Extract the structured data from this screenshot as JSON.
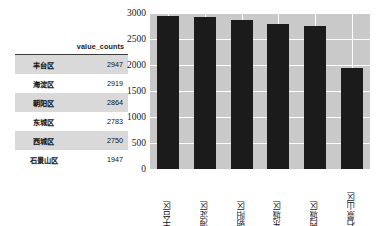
{
  "table": {
    "index_header": "",
    "column_header": "value_counts",
    "rows": [
      {
        "district": "丰台区",
        "count": "2947"
      },
      {
        "district": "海淀区",
        "count": "2919"
      },
      {
        "district": "朝阳区",
        "count": "2864"
      },
      {
        "district": "东城区",
        "count": "2783"
      },
      {
        "district": "西城区",
        "count": "2750"
      },
      {
        "district": "石景山区",
        "count": "1947"
      }
    ]
  },
  "chart_data": {
    "type": "bar",
    "title": "",
    "xlabel": "",
    "ylabel": "",
    "categories": [
      "丰台区",
      "海淀区",
      "朝阳区",
      "东城区",
      "西城区",
      "石景山区"
    ],
    "values": [
      2947,
      2919,
      2864,
      2783,
      2750,
      1947
    ],
    "ylim": [
      0,
      3000
    ],
    "yticks": [
      "0",
      "500",
      "1000",
      "1500",
      "2000",
      "2500",
      "3000"
    ],
    "ytick_values": [
      0,
      500,
      1000,
      1500,
      2000,
      2500,
      3000
    ],
    "grid": true,
    "legend": "none",
    "bar_color": "#1b1b1b",
    "plot_background": "#c9c9c9",
    "grid_color": "#ffffff"
  }
}
